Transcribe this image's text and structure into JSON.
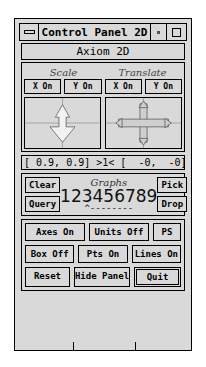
{
  "window": {
    "title": "Control Panel 2D",
    "subtitle": "Axiom 2D",
    "minimize_icon": "minimize-bar-icon",
    "menu_icon": "dot-icon",
    "maximize_icon": "maximize-square-icon"
  },
  "transform": {
    "headers": [
      "Scale",
      "Translate"
    ],
    "scale_buttons": [
      {
        "label": "X On"
      },
      {
        "label": "Y On"
      }
    ],
    "translate_buttons": [
      {
        "label": "X On"
      },
      {
        "label": "Y On"
      }
    ],
    "scale_pad_icon": "vertical-double-arrow-icon",
    "translate_pad_icon": "four-way-arrow-icon"
  },
  "readout": {
    "text": "[ 0.9, 0.9] >1< [  -0,  -0]"
  },
  "graphs": {
    "title": "Graphs",
    "digits": "123456789",
    "marks": "^--------",
    "left_buttons": [
      {
        "label": "Clear"
      },
      {
        "label": "Query"
      }
    ],
    "right_buttons": [
      {
        "label": "Pick"
      },
      {
        "label": "Drop"
      }
    ]
  },
  "options": {
    "row1": [
      {
        "label": "Axes On"
      },
      {
        "label": "Units Off"
      },
      {
        "label": "PS"
      }
    ],
    "row2": [
      {
        "label": "Box Off"
      },
      {
        "label": "Pts On"
      },
      {
        "label": "Lines On"
      }
    ],
    "row3": [
      {
        "label": "Reset"
      },
      {
        "label": "Hide Panel"
      },
      {
        "label": "Quit"
      }
    ]
  },
  "colors": {
    "face": "#d9d9d9",
    "outline": "#000000",
    "page": "#ffffff"
  }
}
